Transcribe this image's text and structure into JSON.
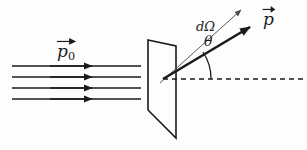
{
  "figure": {
    "name": "particle-scattering-diagram",
    "background_color": "#fdfdfd",
    "ink_color": "#1a1a1a",
    "thin_ink_color": "#555555",
    "width": 307,
    "height": 150
  },
  "labels": {
    "incident_momentum": {
      "symbol": "p",
      "subscript": "0",
      "text": "p0",
      "accent": "vector-arrow",
      "description": "incident beam momentum vector label"
    },
    "scattered_momentum": {
      "symbol": "p",
      "subscript": "",
      "text": "p",
      "accent": "vector-arrow",
      "description": "scattered momentum vector label"
    },
    "solid_angle": {
      "text": "dΩ",
      "description": "differential solid angle element label"
    },
    "scattering_angle": {
      "text": "θ",
      "description": "scattering angle between axis and scattered momentum"
    }
  },
  "geometry": {
    "beam_lines": [
      {
        "x1": 12,
        "y1": 66,
        "x2": 141,
        "y2": 66,
        "arrow_x": 92
      },
      {
        "x1": 12,
        "y1": 77,
        "x2": 141,
        "y2": 77,
        "arrow_x": 92
      },
      {
        "x1": 12,
        "y1": 88,
        "x2": 141,
        "y2": 88,
        "arrow_x": 92
      },
      {
        "x1": 12,
        "y1": 99,
        "x2": 141,
        "y2": 99,
        "arrow_x": 92
      }
    ],
    "target_plane": {
      "shape": "parallelogram",
      "points": "148,40 176,46 176,138 148,110"
    },
    "scatter_origin": {
      "x": 163,
      "y": 79
    },
    "momentum_arrow": {
      "x1": 163,
      "y1": 79,
      "x2": 250,
      "y2": 27
    },
    "solid_angle_ray": {
      "x1": 160,
      "y1": 83,
      "x2": 241,
      "y2": 10
    },
    "axis_dashed_line": {
      "x1": 163,
      "y1": 79,
      "x2": 307,
      "y2": 79
    },
    "angle_arc": {
      "center_x": 163,
      "center_y": 79,
      "radius": 48
    }
  }
}
